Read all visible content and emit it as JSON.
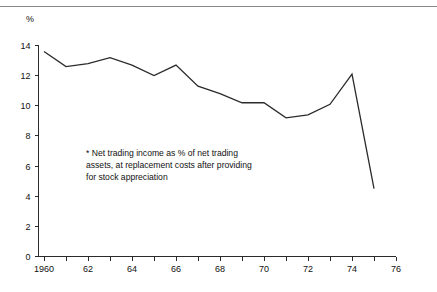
{
  "figure": {
    "unit_label": "%",
    "clipped_title": "",
    "note": "* Net trading income as % of net trading assets, at replacement costs after providing for stock appreciation",
    "line_color": "#2b2b2b",
    "axis_color": "#2b2b2b",
    "rule_color": "#8a8a8a",
    "background": "#ffffff"
  },
  "chart_data": {
    "type": "line",
    "title": "",
    "subtitle": "",
    "xlabel": "",
    "ylabel": "%",
    "xlim": [
      1959,
      1976
    ],
    "ylim": [
      0,
      14
    ],
    "grid": false,
    "legend": null,
    "y_ticks": [
      0,
      2,
      4,
      6,
      8,
      10,
      12,
      14
    ],
    "y_tick_labels": [
      "0",
      "2",
      "4",
      "6",
      "8",
      "10",
      "12",
      "14"
    ],
    "x_ticks": [
      1960,
      1961,
      1962,
      1963,
      1964,
      1965,
      1966,
      1967,
      1968,
      1969,
      1970,
      1971,
      1972,
      1973,
      1974,
      1975,
      1976
    ],
    "x_tick_labels": [
      {
        "x": 1960,
        "label": "1960"
      },
      {
        "x": 1962,
        "label": "62"
      },
      {
        "x": 1964,
        "label": "64"
      },
      {
        "x": 1966,
        "label": "66"
      },
      {
        "x": 1968,
        "label": "68"
      },
      {
        "x": 1970,
        "label": "70"
      },
      {
        "x": 1972,
        "label": "72"
      },
      {
        "x": 1974,
        "label": "74"
      },
      {
        "x": 1976,
        "label": "76"
      }
    ],
    "x": [
      1960,
      1961,
      1962,
      1963,
      1964,
      1965,
      1966,
      1967,
      1968,
      1969,
      1970,
      1971,
      1972,
      1973,
      1974,
      1975
    ],
    "values": [
      13.6,
      12.6,
      12.8,
      13.2,
      12.7,
      12.0,
      12.7,
      11.3,
      10.8,
      10.2,
      10.2,
      9.2,
      9.4,
      10.1,
      12.1,
      4.5
    ],
    "series": [
      {
        "name": "Net trading income as % of net trading assets",
        "x": [
          1960,
          1961,
          1962,
          1963,
          1964,
          1965,
          1966,
          1967,
          1968,
          1969,
          1970,
          1971,
          1972,
          1973,
          1974,
          1975
        ],
        "values": [
          13.6,
          12.6,
          12.8,
          13.2,
          12.7,
          12.0,
          12.7,
          11.3,
          10.8,
          10.2,
          10.2,
          9.2,
          9.4,
          10.1,
          12.1,
          4.5
        ]
      }
    ],
    "annotations": [
      {
        "text": "* Net trading income as % of net trading assets, at replacement costs after providing for stock appreciation",
        "x": 1962.5,
        "y": 6.9
      }
    ]
  }
}
